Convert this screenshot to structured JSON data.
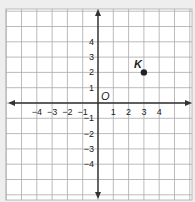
{
  "chart_data": {
    "type": "scatter",
    "title": "",
    "xlabel": "",
    "ylabel": "",
    "xlim": [
      -6,
      6
    ],
    "ylim": [
      -6,
      6
    ],
    "grid": true,
    "origin_label": "O",
    "x_tick_labels": [
      "−4",
      "−3",
      "−2",
      "−1",
      "1",
      "2",
      "3",
      "4"
    ],
    "x_tick_values": [
      -4,
      -3,
      -2,
      -1,
      1,
      2,
      3,
      4
    ],
    "y_tick_labels": [
      "4",
      "3",
      "2",
      "1",
      "−1",
      "−2",
      "−3",
      "−4"
    ],
    "y_tick_values": [
      4,
      3,
      2,
      1,
      -1,
      -2,
      -3,
      -4
    ],
    "points": [
      {
        "label": "K",
        "x": 3,
        "y": 2
      }
    ]
  },
  "colors": {
    "background": "#eeeeee",
    "plot_area": "#ffffff",
    "grid": "#aaaaaa",
    "axis": "#333333",
    "point": "#222222"
  }
}
